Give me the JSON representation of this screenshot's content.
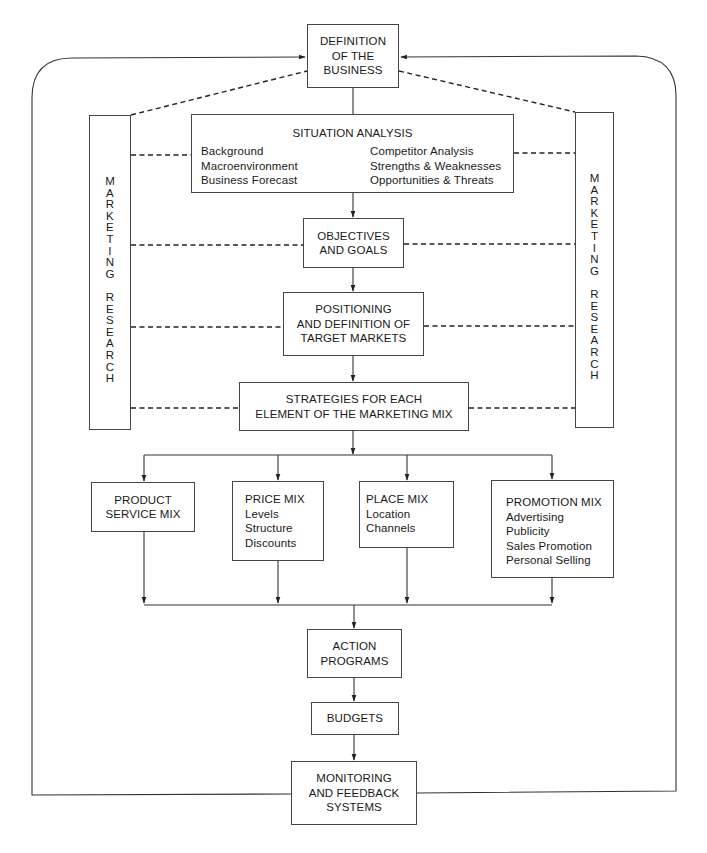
{
  "diagram": {
    "title_nodes": {
      "definition": {
        "lines": [
          "DEFINITION",
          "OF THE",
          "BUSINESS"
        ]
      },
      "situation": {
        "title": "SITUATION ANALYSIS",
        "left_items": [
          "Background",
          "Macroenvironment",
          "Business Forecast"
        ],
        "right_items": [
          "Competitor Analysis",
          "Strengths & Weaknesses",
          "Opportunities & Threats"
        ]
      },
      "objectives": {
        "lines": [
          "OBJECTIVES",
          "AND GOALS"
        ]
      },
      "positioning": {
        "lines": [
          "POSITIONING",
          "AND DEFINITION OF",
          "TARGET MARKETS"
        ]
      },
      "strategies": {
        "lines": [
          "STRATEGIES FOR EACH",
          "ELEMENT OF THE MARKETING MIX"
        ]
      },
      "product": {
        "lines": [
          "PRODUCT",
          "SERVICE MIX"
        ]
      },
      "price": {
        "lines": [
          "PRICE MIX",
          "Levels",
          "Structure",
          "Discounts"
        ]
      },
      "place": {
        "lines": [
          "PLACE MIX",
          "Location",
          "Channels"
        ]
      },
      "promotion": {
        "lines": [
          "PROMOTION MIX",
          "Advertising",
          "Publicity",
          "Sales Promotion",
          "Personal Selling"
        ]
      },
      "action": {
        "lines": [
          "ACTION",
          "PROGRAMS"
        ]
      },
      "budgets": {
        "lines": [
          "BUDGETS"
        ]
      },
      "monitoring": {
        "lines": [
          "MONITORING",
          "AND FEEDBACK",
          "SYSTEMS"
        ]
      }
    },
    "side_panels": {
      "left": {
        "letters": [
          "M",
          "A",
          "R",
          "K",
          "E",
          "T",
          "I",
          "N",
          "G",
          " ",
          "R",
          "E",
          "S",
          "E",
          "A",
          "R",
          "C",
          "H"
        ]
      },
      "right": {
        "letters": [
          "M",
          "A",
          "R",
          "K",
          "E",
          "T",
          "I",
          "N",
          "G",
          " ",
          "R",
          "E",
          "S",
          "E",
          "A",
          "R",
          "C",
          "H"
        ]
      }
    },
    "colors": {
      "line": "#333333",
      "box_border": "#444444",
      "text": "#1a1a1a",
      "background": "#ffffff"
    }
  }
}
